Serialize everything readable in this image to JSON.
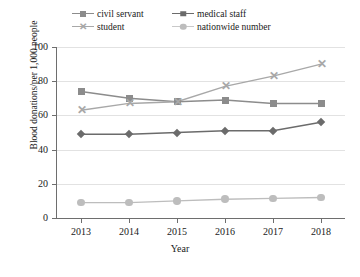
{
  "chart_data": {
    "type": "line",
    "title": "",
    "xlabel": "Year",
    "ylabel": "Blood donations/per 1,000 people",
    "categories": [
      "2013",
      "2014",
      "2015",
      "2016",
      "2017",
      "2018"
    ],
    "x": [
      2013,
      2014,
      2015,
      2016,
      2017,
      2018
    ],
    "xlim": [
      2012.7,
      2018.3
    ],
    "ylim": [
      0,
      100
    ],
    "yticks": [
      0,
      20,
      40,
      60,
      80,
      100
    ],
    "grid": true,
    "legend_position": "top",
    "series": [
      {
        "name": "civil servant",
        "marker": "square",
        "color": "#8c8c8c",
        "values": [
          74,
          70,
          68,
          69,
          67,
          67
        ]
      },
      {
        "name": "medical staff",
        "marker": "diamond",
        "color": "#6b6b6b",
        "values": [
          49,
          49,
          50,
          51,
          51,
          56
        ]
      },
      {
        "name": "student",
        "marker": "x",
        "color": "#a8a8a8",
        "values": [
          63,
          67,
          68,
          77,
          83,
          90
        ]
      },
      {
        "name": "nationwide number",
        "marker": "circle",
        "color": "#bdbdbd",
        "values": [
          9,
          9,
          10,
          11,
          11.5,
          12
        ]
      }
    ]
  },
  "legend": {
    "items": [
      {
        "label": "civil servant",
        "marker": "square-marker",
        "color": "#8c8c8c"
      },
      {
        "label": "medical staff",
        "marker": "diamond-marker",
        "color": "#6b6b6b"
      },
      {
        "label": "student",
        "marker": "x-marker",
        "color": "#a8a8a8"
      },
      {
        "label": "nationwide number",
        "marker": "circle-marker",
        "color": "#bdbdbd"
      }
    ]
  },
  "axes": {
    "y_tick_labels": [
      "100",
      "80",
      "60",
      "40",
      "20",
      "0"
    ],
    "x_tick_labels": [
      "2013",
      "2014",
      "2015",
      "2016",
      "2017",
      "2018"
    ],
    "y_axis_title": "Blood donations/per 1,000 people",
    "x_axis_title": "Year"
  }
}
